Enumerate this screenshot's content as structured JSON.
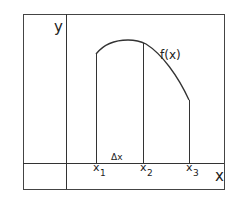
{
  "diagram": {
    "axes": {
      "y_label": "y",
      "x_label": "x"
    },
    "curve_label": "f(x)",
    "interval_label": "Δx",
    "points": [
      {
        "name": "x",
        "sub": "1"
      },
      {
        "name": "x",
        "sub": "2"
      },
      {
        "name": "x",
        "sub": "3"
      }
    ],
    "colors": {
      "line": "#333333",
      "background": "#ffffff"
    }
  }
}
